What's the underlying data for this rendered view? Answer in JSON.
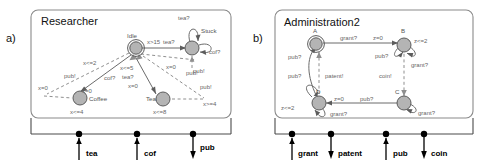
{
  "figure": {
    "panels": [
      {
        "tag": "a)",
        "title": "Researcher",
        "states": [
          {
            "id": "idle",
            "label": "Idle",
            "invariant": "x>15",
            "initial": true
          },
          {
            "id": "stuck",
            "label": "Stuck",
            "invariant": "",
            "initial": false
          },
          {
            "id": "coffee",
            "label": "Coffee",
            "invariant": "x<=4",
            "initial": false
          },
          {
            "id": "tea",
            "label": "Tea",
            "invariant": "x<=8",
            "initial": false
          }
        ],
        "edge_labels": [
          "tea?",
          "tea?",
          "cof?",
          "pub!",
          "x<=2",
          "pub!",
          "x=0",
          "cof?",
          "x=0",
          "x<=5",
          "tea?",
          "x=0",
          "x=0",
          "pub!",
          "pub!",
          "x>=4"
        ],
        "ports": [
          {
            "name": "tea",
            "direction": "in"
          },
          {
            "name": "cof",
            "direction": "in"
          },
          {
            "name": "pub",
            "direction": "out"
          }
        ]
      },
      {
        "tag": "b)",
        "title": "Administration2",
        "states": [
          {
            "id": "A",
            "label": "A",
            "invariant": "",
            "initial": true
          },
          {
            "id": "B",
            "label": "B",
            "invariant": "z<=2",
            "initial": false
          },
          {
            "id": "C",
            "label": "C",
            "invariant": "",
            "initial": false
          },
          {
            "id": "D",
            "label": "D",
            "invariant": "z<=2",
            "initial": false
          }
        ],
        "edge_labels": [
          "grant?",
          "z=0",
          "pub?",
          "grant?",
          "pub?",
          "pub?",
          "patent!",
          "coin!",
          "z=0",
          "pub?",
          "grant?",
          "grant?",
          "z<=2"
        ],
        "ports": [
          {
            "name": "grant",
            "direction": "in"
          },
          {
            "name": "patent",
            "direction": "out"
          },
          {
            "name": "pub",
            "direction": "in"
          },
          {
            "name": "coin",
            "direction": "out"
          }
        ]
      }
    ]
  },
  "labels": {
    "a": {
      "tag": "a)",
      "title": "Researcher",
      "idle": "Idle",
      "idle_inv": "x>15",
      "stuck": "Stuck",
      "stuck_loop_top": "tea?",
      "stuck_loop_right": "cof?",
      "stuck_in": "tea?",
      "stuck_pub": "pub!",
      "coffee": "Coffee",
      "coffee_inv": "x<=4",
      "tea": "Tea",
      "tea_inv": "x<=8",
      "g_xle2": "x<=2",
      "g_publ": "pub!",
      "g_x0_left": "x=0",
      "g_cof": "cof?",
      "g_x0_cof": "x=0",
      "g_xle5": "x<=5",
      "g_tea": "tea?",
      "g_x0_tea": "x=0",
      "g_x0_right": "x=0",
      "g_pub_r1": "pub!",
      "g_pub_r2": "pub!",
      "g_xge4": "x>=4",
      "port_tea": "tea",
      "port_cof": "cof",
      "port_pub": "pub"
    },
    "b": {
      "tag": "b)",
      "title": "Administration2",
      "A": "A",
      "B": "B",
      "C": "C",
      "D": "D",
      "B_inv": "z<=2",
      "D_inv": "z<=2",
      "e_grant_top": "grant?",
      "e_z0_top": "z=0",
      "e_pub_B": "pub?",
      "e_grant_B": "grant?",
      "e_pub_left1": "pub?",
      "e_pub_left2": "pub?",
      "e_patent": "patent!",
      "e_coin": "coin!",
      "e_z0_bot": "z=0",
      "e_pub_bot": "pub?",
      "e_grant_D": "grant?",
      "e_grant_C": "grant?",
      "port_grant": "grant",
      "port_patent": "patent",
      "port_pub": "pub",
      "port_coin": "coin"
    }
  }
}
